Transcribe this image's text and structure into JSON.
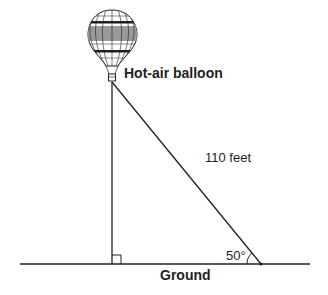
{
  "diagram": {
    "labels": {
      "balloon": "Hot-air balloon",
      "hypotenuse": "110 feet",
      "angle": "50°",
      "ground": "Ground"
    },
    "geometry": {
      "hypotenuse_length_ft": 110,
      "ground_angle_deg": 50,
      "right_angle_at": "base of vertical line"
    },
    "colors": {
      "stroke": "#231f20",
      "balloon_band": "#9a9a9a",
      "background": "#ffffff"
    }
  }
}
